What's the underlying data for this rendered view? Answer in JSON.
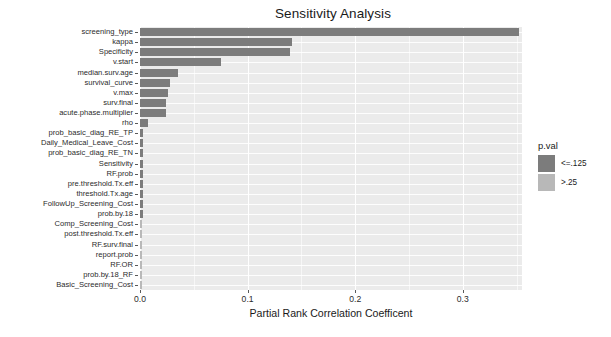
{
  "chart_data": {
    "type": "bar",
    "orientation": "horizontal",
    "title": "Sensitivity Analysis",
    "xlabel": "Partial Rank Correlation Coefficent",
    "ylabel": "",
    "xlim": [
      0.0,
      0.355
    ],
    "xticks": [
      0.0,
      0.1,
      0.2,
      0.3
    ],
    "xticklabels": [
      "0.0",
      "0.1",
      "0.2",
      "0.3"
    ],
    "grid": true,
    "legend": {
      "title": "p.val",
      "position": "right",
      "entries": [
        {
          "label": "<=.125",
          "color": "#7c7c7c"
        },
        {
          "label": ">.25",
          "color": "#b8b8b8"
        }
      ]
    },
    "categories": [
      "screening_type",
      "kappa",
      "Specificity",
      "v.start",
      "median.surv.age",
      "survival_curve",
      "v.max",
      "surv.final",
      "acute.phase.multiplier",
      "rho",
      "prob_basic_diag_RE_TP",
      "Daily_Medical_Leave_Cost",
      "prob_basic_diag_RE_TN",
      "Sensitivity",
      "RF.prob",
      "pre.threshold.Tx.eff",
      "threshold.Tx.age",
      "FollowUp_Screening_Cost",
      "prob.by.18",
      "Comp_Screening_Cost",
      "post.threshold.Tx.eff",
      "RF.surv.final",
      "report.prob",
      "RF.OR",
      "prob.by.18_RF",
      "Basic_Screening_Cost"
    ],
    "values": [
      0.352,
      0.141,
      0.139,
      0.075,
      0.035,
      0.028,
      0.026,
      0.024,
      0.024,
      0.0075,
      0.0032,
      0.0032,
      0.003,
      0.003,
      0.003,
      0.0028,
      0.0028,
      0.0026,
      0.0026,
      0.0008,
      0.0007,
      0.0006,
      0.0005,
      0.0005,
      0.0004,
      0.0003
    ],
    "pval_group": [
      "<=.125",
      "<=.125",
      "<=.125",
      "<=.125",
      "<=.125",
      "<=.125",
      "<=.125",
      "<=.125",
      "<=.125",
      "<=.125",
      "<=.125",
      "<=.125",
      "<=.125",
      "<=.125",
      "<=.125",
      "<=.125",
      "<=.125",
      "<=.125",
      "<=.125",
      ">.25",
      ">.25",
      ">.25",
      ">.25",
      ">.25",
      ">.25",
      ">.25"
    ]
  },
  "style": {
    "panel_background": "#ebebeb",
    "grid_color": "#ffffff",
    "figure_background": "#ffffff",
    "bar_color_dark": "#7c7c7c",
    "bar_color_light": "#b8b8b8",
    "text_color": "#1a1a1a"
  }
}
